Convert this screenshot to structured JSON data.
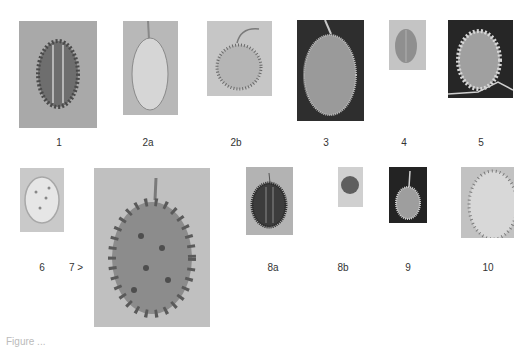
{
  "figure": {
    "caption_partial": "Figure ..."
  },
  "specimens": [
    {
      "id": "1",
      "label": "1",
      "description": "spiny oval fruit, grey background",
      "bg": "#a9a9a9",
      "fruit": "#6e6e6e"
    },
    {
      "id": "2a",
      "label": "2a",
      "description": "smooth elongated fruit with stem",
      "bg": "#b8b8b8",
      "fruit": "#d6d6d6"
    },
    {
      "id": "2b",
      "label": "2b",
      "description": "round hairy fruit with curled stem",
      "bg": "#c6c6c6",
      "fruit": "#a3a3a3"
    },
    {
      "id": "3",
      "label": "3",
      "description": "large fuzzy oval fruit, dark background",
      "bg": "#2e2e2e",
      "fruit": "#9a9a9a"
    },
    {
      "id": "4",
      "label": "4",
      "description": "small ribbed oval fruit",
      "bg": "#c4c4c4",
      "fruit": "#8f8f8f"
    },
    {
      "id": "5",
      "label": "5",
      "description": "spiny fruit on dark background",
      "bg": "#262626",
      "fruit": "#b0b0b0"
    },
    {
      "id": "6",
      "label": "6",
      "description": "pale spotted oval fruit",
      "bg": "#c9c9c9",
      "fruit": "#e6e6e6"
    },
    {
      "id": "7",
      "label": "7 >",
      "description": "large horned melon with stem",
      "bg": "#c0c0c0",
      "fruit": "#8c8c8c"
    },
    {
      "id": "8a",
      "label": "8a",
      "description": "dark ribbed spiny fruit",
      "bg": "#b3b3b3",
      "fruit": "#3c3c3c"
    },
    {
      "id": "8b",
      "label": "8b",
      "description": "small round fruit",
      "bg": "#d0d0d0",
      "fruit": "#5e5e5e"
    },
    {
      "id": "9",
      "label": "9",
      "description": "ribbed fruit with stem, dark background",
      "bg": "#232323",
      "fruit": "#9e9e9e"
    },
    {
      "id": "10",
      "label": "10",
      "description": "pale hairy fruit close-up",
      "bg": "#c2c2c2",
      "fruit": "#d8d8d8"
    }
  ]
}
